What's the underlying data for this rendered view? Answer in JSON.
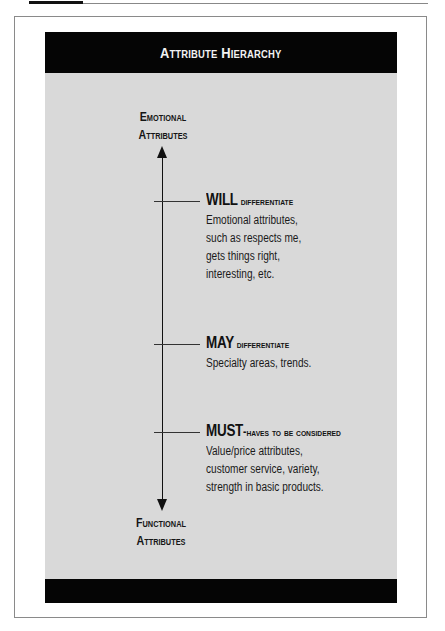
{
  "diagram": {
    "title": "Attribute Hierarchy",
    "axis": {
      "top_label_line1": "Emotional",
      "top_label_line2": "Attributes",
      "bottom_label_line1": "Functional",
      "bottom_label_line2": "Attributes"
    },
    "levels": [
      {
        "keyword": "WILL",
        "rest": " differentiate",
        "description": [
          "Emotional attributes,",
          "such as respects me,",
          "gets things right,",
          "interesting, etc."
        ]
      },
      {
        "keyword": "MAY",
        "rest": " differentiate",
        "description": [
          "Specialty areas, trends."
        ]
      },
      {
        "keyword": "MUST",
        "rest": "-haves to be considered",
        "description": [
          "Value/price attributes,",
          "customer service, variety,",
          "strength in basic products."
        ]
      }
    ],
    "colors": {
      "header_bg": "#050505",
      "panel_bg": "#d9d9d9",
      "text": "#111111"
    }
  }
}
